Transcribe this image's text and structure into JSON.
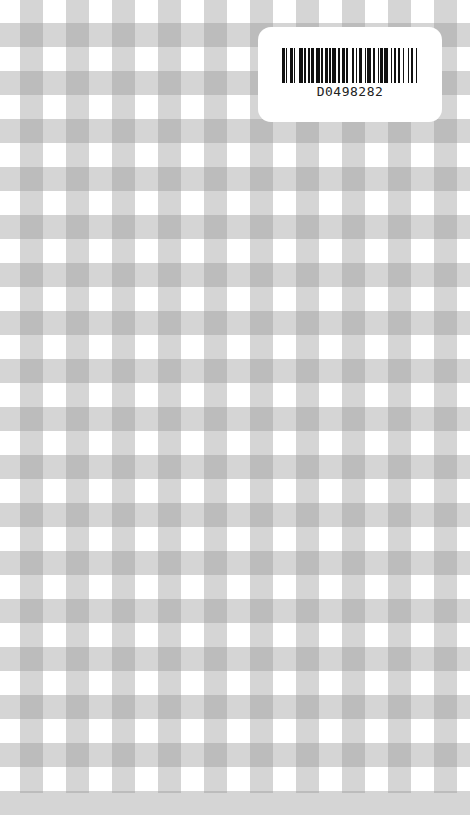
{
  "background": {
    "pattern": "gingham",
    "colors": {
      "base": "#ffffff",
      "band": "#d4d4d4",
      "intersection": "#a9a9a9"
    },
    "vertical_band_start_x": 20,
    "horizontal_band_start_y": 23
  },
  "label": {
    "barcode_icon": "barcode-icon",
    "barcode_text": "D0498282"
  }
}
